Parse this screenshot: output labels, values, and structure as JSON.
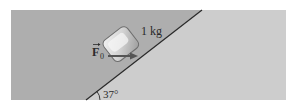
{
  "diagram": {
    "type": "inclined-plane-free-body",
    "mass_label": "1 kg",
    "force_label": "F",
    "force_subscript": "0",
    "angle_label": "37°",
    "colors": {
      "background": "#ffffff",
      "upper_region": "#aeaeae",
      "lower_region": "#cdcdcd",
      "incline_line": "#2a2a2a",
      "block_fill": "#c8c8c8",
      "block_highlight": "#f2f2f2",
      "block_edge": "#6e6e6e",
      "arrow": "#555555"
    }
  }
}
